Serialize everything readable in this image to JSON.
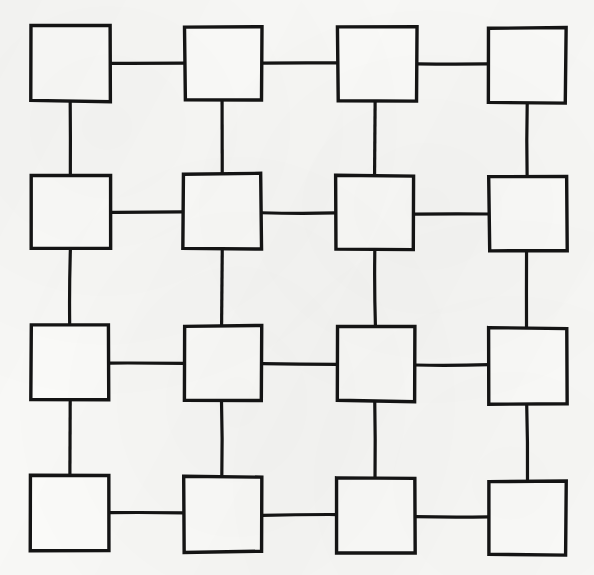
{
  "figure": {
    "medium": "ink on paper",
    "background_color": "#f8f8f6",
    "ink_color": "#141414",
    "node_fill_color": "#fbfbf9",
    "canvas": {
      "width": 594,
      "height": 575
    },
    "rows": 4,
    "columns": 4,
    "node_count": 16,
    "edge_count": 24,
    "stroke_width": 3.4,
    "connector_stroke_width": 3.2
  },
  "grid": {
    "row_centers": [
      63,
      211,
      363,
      514
    ],
    "column_centers": [
      70,
      222,
      375,
      527
    ],
    "nodes": [
      {
        "id": "r1c1",
        "row": 1,
        "col": 1,
        "x": 31,
        "y": 26,
        "w": 79,
        "h": 75
      },
      {
        "id": "r1c2",
        "row": 1,
        "col": 2,
        "x": 185,
        "y": 27,
        "w": 77,
        "h": 73
      },
      {
        "id": "r1c3",
        "row": 1,
        "col": 3,
        "x": 338,
        "y": 27,
        "w": 79,
        "h": 74
      },
      {
        "id": "r1c4",
        "row": 1,
        "col": 4,
        "x": 488,
        "y": 28,
        "w": 78,
        "h": 75
      },
      {
        "id": "r2c1",
        "row": 2,
        "col": 1,
        "x": 31,
        "y": 175,
        "w": 79,
        "h": 74
      },
      {
        "id": "r2c2",
        "row": 2,
        "col": 2,
        "x": 183,
        "y": 174,
        "w": 78,
        "h": 75
      },
      {
        "id": "r2c3",
        "row": 2,
        "col": 3,
        "x": 336,
        "y": 176,
        "w": 78,
        "h": 73
      },
      {
        "id": "r2c4",
        "row": 2,
        "col": 4,
        "x": 489,
        "y": 177,
        "w": 78,
        "h": 74
      },
      {
        "id": "r3c1",
        "row": 3,
        "col": 1,
        "x": 31,
        "y": 325,
        "w": 78,
        "h": 75
      },
      {
        "id": "r3c2",
        "row": 3,
        "col": 2,
        "x": 184,
        "y": 326,
        "w": 78,
        "h": 75
      },
      {
        "id": "r3c3",
        "row": 3,
        "col": 3,
        "x": 337,
        "y": 327,
        "w": 78,
        "h": 74
      },
      {
        "id": "r3c4",
        "row": 3,
        "col": 4,
        "x": 489,
        "y": 328,
        "w": 78,
        "h": 76
      },
      {
        "id": "r4c1",
        "row": 4,
        "col": 1,
        "x": 31,
        "y": 476,
        "w": 78,
        "h": 75
      },
      {
        "id": "r4c2",
        "row": 4,
        "col": 2,
        "x": 184,
        "y": 477,
        "w": 78,
        "h": 75
      },
      {
        "id": "r4c3",
        "row": 4,
        "col": 3,
        "x": 337,
        "y": 478,
        "w": 78,
        "h": 75
      },
      {
        "id": "r4c4",
        "row": 4,
        "col": 4,
        "x": 489,
        "y": 481,
        "w": 77,
        "h": 74
      }
    ],
    "horizontal_edges": [
      {
        "id": "h-r1-c1c2",
        "row": 1,
        "from": "r1c1",
        "to": "r1c2",
        "x1": 110,
        "x2": 185,
        "y": 63
      },
      {
        "id": "h-r1-c2c3",
        "row": 1,
        "from": "r1c2",
        "to": "r1c3",
        "x1": 262,
        "x2": 338,
        "y": 63
      },
      {
        "id": "h-r1-c3c4",
        "row": 1,
        "from": "r1c3",
        "to": "r1c4",
        "x1": 417,
        "x2": 488,
        "y": 64
      },
      {
        "id": "h-r2-c1c2",
        "row": 2,
        "from": "r2c1",
        "to": "r2c2",
        "x1": 110,
        "x2": 183,
        "y": 212
      },
      {
        "id": "h-r2-c2c3",
        "row": 2,
        "from": "r2c2",
        "to": "r2c3",
        "x1": 261,
        "x2": 336,
        "y": 213
      },
      {
        "id": "h-r2-c3c4",
        "row": 2,
        "from": "r2c3",
        "to": "r2c4",
        "x1": 414,
        "x2": 489,
        "y": 214
      },
      {
        "id": "h-r3-c1c2",
        "row": 3,
        "from": "r3c1",
        "to": "r3c2",
        "x1": 109,
        "x2": 184,
        "y": 363
      },
      {
        "id": "h-r3-c2c3",
        "row": 3,
        "from": "r3c2",
        "to": "r3c3",
        "x1": 262,
        "x2": 337,
        "y": 364
      },
      {
        "id": "h-r3-c3c4",
        "row": 3,
        "from": "r3c3",
        "to": "r3c4",
        "x1": 415,
        "x2": 489,
        "y": 365
      },
      {
        "id": "h-r4-c1c2",
        "row": 4,
        "from": "r4c1",
        "to": "r4c2",
        "x1": 109,
        "x2": 184,
        "y": 513
      },
      {
        "id": "h-r4-c2c3",
        "row": 4,
        "from": "r4c2",
        "to": "r4c3",
        "x1": 262,
        "x2": 337,
        "y": 515
      },
      {
        "id": "h-r4-c3c4",
        "row": 4,
        "from": "r4c3",
        "to": "r4c4",
        "x1": 415,
        "x2": 489,
        "y": 517
      }
    ],
    "vertical_edges": [
      {
        "id": "v-c1-r1r2",
        "col": 1,
        "from": "r1c1",
        "to": "r2c1",
        "y1": 101,
        "y2": 175,
        "x": 70
      },
      {
        "id": "v-c1-r2r3",
        "col": 1,
        "from": "r2c1",
        "to": "r3c1",
        "y1": 249,
        "y2": 325,
        "x": 70
      },
      {
        "id": "v-c1-r3r4",
        "col": 1,
        "from": "r3c1",
        "to": "r4c1",
        "y1": 400,
        "y2": 476,
        "x": 70
      },
      {
        "id": "v-c2-r1r2",
        "col": 2,
        "from": "r1c2",
        "to": "r2c2",
        "y1": 100,
        "y2": 174,
        "x": 222
      },
      {
        "id": "v-c2-r2r3",
        "col": 2,
        "from": "r2c2",
        "to": "r3c2",
        "y1": 249,
        "y2": 326,
        "x": 222
      },
      {
        "id": "v-c2-r3r4",
        "col": 2,
        "from": "r3c2",
        "to": "r4c2",
        "y1": 401,
        "y2": 477,
        "x": 222
      },
      {
        "id": "v-c3-r1r2",
        "col": 3,
        "from": "r1c3",
        "to": "r2c3",
        "y1": 101,
        "y2": 176,
        "x": 375
      },
      {
        "id": "v-c3-r2r3",
        "col": 3,
        "from": "r2c3",
        "to": "r3c3",
        "y1": 249,
        "y2": 327,
        "x": 375
      },
      {
        "id": "v-c3-r3r4",
        "col": 3,
        "from": "r3c3",
        "to": "r4c3",
        "y1": 401,
        "y2": 478,
        "x": 375
      },
      {
        "id": "v-c4-r1r2",
        "col": 4,
        "from": "r1c4",
        "to": "r2c4",
        "y1": 103,
        "y2": 177,
        "x": 527
      },
      {
        "id": "v-c4-r2r3",
        "col": 4,
        "from": "r2c4",
        "to": "r3c4",
        "y1": 251,
        "y2": 328,
        "x": 527
      },
      {
        "id": "v-c4-r3r4",
        "col": 4,
        "from": "r3c4",
        "to": "r4c4",
        "y1": 404,
        "y2": 481,
        "x": 527
      }
    ]
  }
}
